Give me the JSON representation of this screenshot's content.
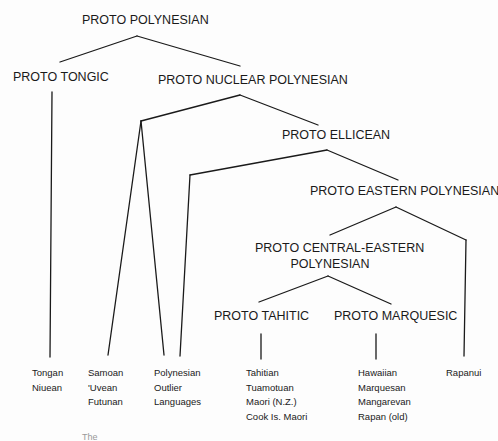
{
  "diagram": {
    "type": "language-family-tree",
    "nodes": {
      "root": "PROTO POLYNESIAN",
      "tongic": "PROTO TONGIC",
      "nuclear": "PROTO NUCLEAR POLYNESIAN",
      "ellicean": "PROTO ELLICEAN",
      "eastern": "PROTO EASTERN POLYNESIAN",
      "central_eastern_line1": "PROTO CENTRAL-EASTERN",
      "central_eastern_line2": "POLYNESIAN",
      "tahitic": "PROTO TAHITIC",
      "marquesic": "PROTO MARQUESIC"
    },
    "leaves": {
      "tongic_group": [
        "Tongan",
        "Niuean"
      ],
      "samoic_group": [
        "Samoan",
        "'Uvean",
        "Futunan"
      ],
      "outlier_group": [
        "Polynesian",
        "Outlier",
        "Languages"
      ],
      "tahitic_group": [
        "Tahitian",
        "Tuamotuan",
        "Maori (N.Z.)",
        "Cook Is. Maori"
      ],
      "marquesic_group": [
        "Hawaiian",
        "Marquesan",
        "Mangarevan",
        "Rapan (old)"
      ],
      "rapanui_group": [
        "Rapanui"
      ]
    },
    "edges": [
      [
        "PROTO POLYNESIAN",
        "PROTO TONGIC"
      ],
      [
        "PROTO POLYNESIAN",
        "PROTO NUCLEAR POLYNESIAN"
      ],
      [
        "PROTO TONGIC",
        "Tongan / Niuean"
      ],
      [
        "PROTO NUCLEAR POLYNESIAN",
        "Samoan / 'Uvean / Futunan"
      ],
      [
        "PROTO NUCLEAR POLYNESIAN",
        "Polynesian Outlier Languages"
      ],
      [
        "PROTO NUCLEAR POLYNESIAN",
        "PROTO ELLICEAN"
      ],
      [
        "PROTO ELLICEAN",
        "Polynesian Outlier Languages"
      ],
      [
        "PROTO ELLICEAN",
        "PROTO EASTERN POLYNESIAN"
      ],
      [
        "PROTO EASTERN POLYNESIAN",
        "PROTO CENTRAL-EASTERN POLYNESIAN"
      ],
      [
        "PROTO EASTERN POLYNESIAN",
        "Rapanui"
      ],
      [
        "PROTO CENTRAL-EASTERN POLYNESIAN",
        "PROTO TAHITIC"
      ],
      [
        "PROTO CENTRAL-EASTERN POLYNESIAN",
        "PROTO MARQUESIC"
      ],
      [
        "PROTO TAHITIC",
        "Tahitian / Tuamotuan / Maori (N.Z.) / Cook Is. Maori"
      ],
      [
        "PROTO MARQUESIC",
        "Hawaiian / Marquesan / Mangarevan / Rapan (old)"
      ]
    ],
    "caption_fragment": "The"
  }
}
